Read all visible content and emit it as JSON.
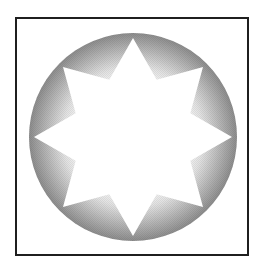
{
  "diagram": {
    "type": "radial-gradient-circle-with-star",
    "frame": {
      "border_color": "#1f1f1f"
    },
    "circle": {
      "center_x": 133,
      "center_y": 137,
      "radius": 104,
      "gradient_inner_color": "#ffffff",
      "gradient_outer_color": "#8c8c8c"
    },
    "star": {
      "points": 8,
      "outer_radius": 99,
      "inner_radius": 62,
      "fill_color": "#ffffff"
    }
  }
}
